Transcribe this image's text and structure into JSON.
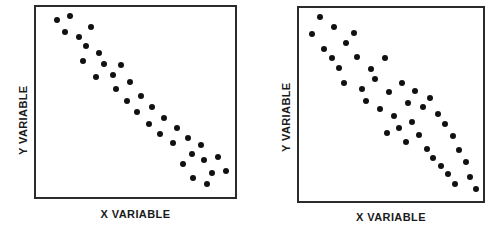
{
  "figure": {
    "background": "#ffffff",
    "ink_color": "#111111",
    "frame_color": "#2b2b2b"
  },
  "chart_data": [
    {
      "type": "scatter",
      "title": "",
      "xlabel": "X  VARIABLE",
      "ylabel": "Y  VARIABLE",
      "grid": false,
      "legend": "none",
      "xlim": [
        0,
        100
      ],
      "ylim": [
        0,
        100
      ],
      "relationship": "strong positive linear correlation",
      "n_points": 33,
      "x": [
        7,
        12,
        10,
        15,
        19,
        17,
        21,
        24,
        20,
        26,
        29,
        24,
        31,
        28,
        33,
        36,
        31,
        38,
        41,
        35,
        44,
        39,
        47,
        43,
        50,
        53,
        49,
        56,
        59,
        54,
        64,
        70,
        77
      ],
      "y": [
        6,
        5,
        12,
        14,
        10,
        19,
        17,
        13,
        24,
        22,
        19,
        30,
        26,
        34,
        31,
        27,
        38,
        35,
        31,
        42,
        38,
        47,
        43,
        52,
        49,
        45,
        56,
        54,
        49,
        60,
        65,
        62,
        68
      ],
      "series": [
        {
          "name": "observations",
          "points": [
            [
              7,
              6
            ],
            [
              12,
              5
            ],
            [
              10,
              12
            ],
            [
              15,
              14
            ],
            [
              19,
              10
            ],
            [
              17,
              19
            ],
            [
              21,
              17
            ],
            [
              24,
              13
            ],
            [
              20,
              24
            ],
            [
              26,
              22
            ],
            [
              29,
              19
            ],
            [
              24,
              30
            ],
            [
              31,
              26
            ],
            [
              28,
              34
            ],
            [
              33,
              31
            ],
            [
              36,
              27
            ],
            [
              31,
              38
            ],
            [
              38,
              35
            ],
            [
              41,
              31
            ],
            [
              35,
              42
            ],
            [
              44,
              38
            ],
            [
              39,
              47
            ],
            [
              47,
              43
            ],
            [
              43,
              52
            ],
            [
              50,
              49
            ],
            [
              53,
              45
            ],
            [
              49,
              56
            ],
            [
              56,
              54
            ],
            [
              59,
              49
            ],
            [
              54,
              60
            ],
            [
              64,
              65
            ],
            [
              70,
              62
            ],
            [
              77,
              68
            ]
          ]
        }
      ]
    },
    {
      "type": "scatter",
      "title": "",
      "xlabel": "X  VARIABLE",
      "ylabel": "Y  VARIABLE",
      "grid": false,
      "legend": "none",
      "xlim": [
        0,
        100
      ],
      "ylim": [
        0,
        100
      ],
      "relationship": "moderate positive correlation with wide scatter",
      "n_points": 40,
      "x": [
        7,
        12,
        19,
        14,
        12,
        23,
        28,
        18,
        29,
        22,
        36,
        31,
        42,
        38,
        33,
        45,
        40,
        52,
        47,
        55,
        50,
        58,
        44,
        53,
        62,
        57,
        66,
        60,
        70,
        64,
        74,
        68,
        78,
        72,
        82,
        76,
        86,
        80,
        84,
        90
      ],
      "y": [
        12,
        6,
        11,
        18,
        23,
        16,
        14,
        28,
        22,
        35,
        30,
        42,
        26,
        38,
        48,
        44,
        55,
        40,
        58,
        52,
        64,
        48,
        62,
        70,
        56,
        66,
        60,
        74,
        52,
        72,
        64,
        78,
        58,
        70,
        66,
        80,
        54,
        76,
        84,
        68
      ]
    }
  ],
  "charts": [
    {
      "panel_id": "left",
      "y_axis_label": "Y  VARIABLE",
      "x_axis_label": "X  VARIABLE",
      "points": [
        [
          10.5,
          93.0
        ],
        [
          17.0,
          95.5
        ],
        [
          14.5,
          87.0
        ],
        [
          21.5,
          84.0
        ],
        [
          27.5,
          89.5
        ],
        [
          25.0,
          79.5
        ],
        [
          31.5,
          76.0
        ],
        [
          23.5,
          71.5
        ],
        [
          34.0,
          70.0
        ],
        [
          30.0,
          63.0
        ],
        [
          38.5,
          64.0
        ],
        [
          42.5,
          69.5
        ],
        [
          40.0,
          57.0
        ],
        [
          47.0,
          60.5
        ],
        [
          45.5,
          50.5
        ],
        [
          53.0,
          53.0
        ],
        [
          51.0,
          44.5
        ],
        [
          58.5,
          47.5
        ],
        [
          57.0,
          38.5
        ],
        [
          64.5,
          41.5
        ],
        [
          62.5,
          33.0
        ],
        [
          69.0,
          28.5
        ],
        [
          71.0,
          36.5
        ],
        [
          76.5,
          31.0
        ],
        [
          78.5,
          22.5
        ],
        [
          74.0,
          17.5
        ],
        [
          84.5,
          19.5
        ],
        [
          83.0,
          27.5
        ],
        [
          88.5,
          12.5
        ],
        [
          91.5,
          21.0
        ],
        [
          95.5,
          13.5
        ],
        [
          79.0,
          10.0
        ],
        [
          86.0,
          7.0
        ]
      ]
    },
    {
      "panel_id": "right",
      "y_axis_label": "Y  VARIABLE",
      "x_axis_label": "X  VARIABLE",
      "points": [
        [
          7.0,
          86.5
        ],
        [
          11.5,
          95.5
        ],
        [
          19.0,
          90.0
        ],
        [
          13.5,
          78.5
        ],
        [
          18.0,
          74.0
        ],
        [
          25.5,
          82.0
        ],
        [
          30.0,
          87.0
        ],
        [
          22.0,
          69.0
        ],
        [
          31.5,
          74.5
        ],
        [
          24.5,
          61.0
        ],
        [
          39.0,
          68.5
        ],
        [
          34.0,
          58.0
        ],
        [
          46.5,
          74.0
        ],
        [
          41.5,
          63.0
        ],
        [
          36.5,
          52.0
        ],
        [
          49.0,
          56.5
        ],
        [
          44.0,
          47.5
        ],
        [
          56.0,
          61.0
        ],
        [
          51.5,
          44.0
        ],
        [
          59.5,
          51.0
        ],
        [
          54.5,
          38.0
        ],
        [
          63.0,
          57.0
        ],
        [
          48.0,
          35.0
        ],
        [
          58.0,
          30.5
        ],
        [
          67.5,
          48.5
        ],
        [
          61.5,
          41.0
        ],
        [
          71.0,
          53.5
        ],
        [
          65.0,
          34.0
        ],
        [
          75.5,
          45.0
        ],
        [
          69.5,
          27.0
        ],
        [
          79.5,
          40.0
        ],
        [
          73.0,
          22.5
        ],
        [
          83.5,
          33.5
        ],
        [
          77.0,
          18.0
        ],
        [
          87.0,
          26.5
        ],
        [
          81.0,
          14.0
        ],
        [
          90.5,
          20.0
        ],
        [
          85.0,
          9.0
        ],
        [
          93.0,
          12.5
        ],
        [
          96.0,
          6.0
        ]
      ]
    }
  ]
}
